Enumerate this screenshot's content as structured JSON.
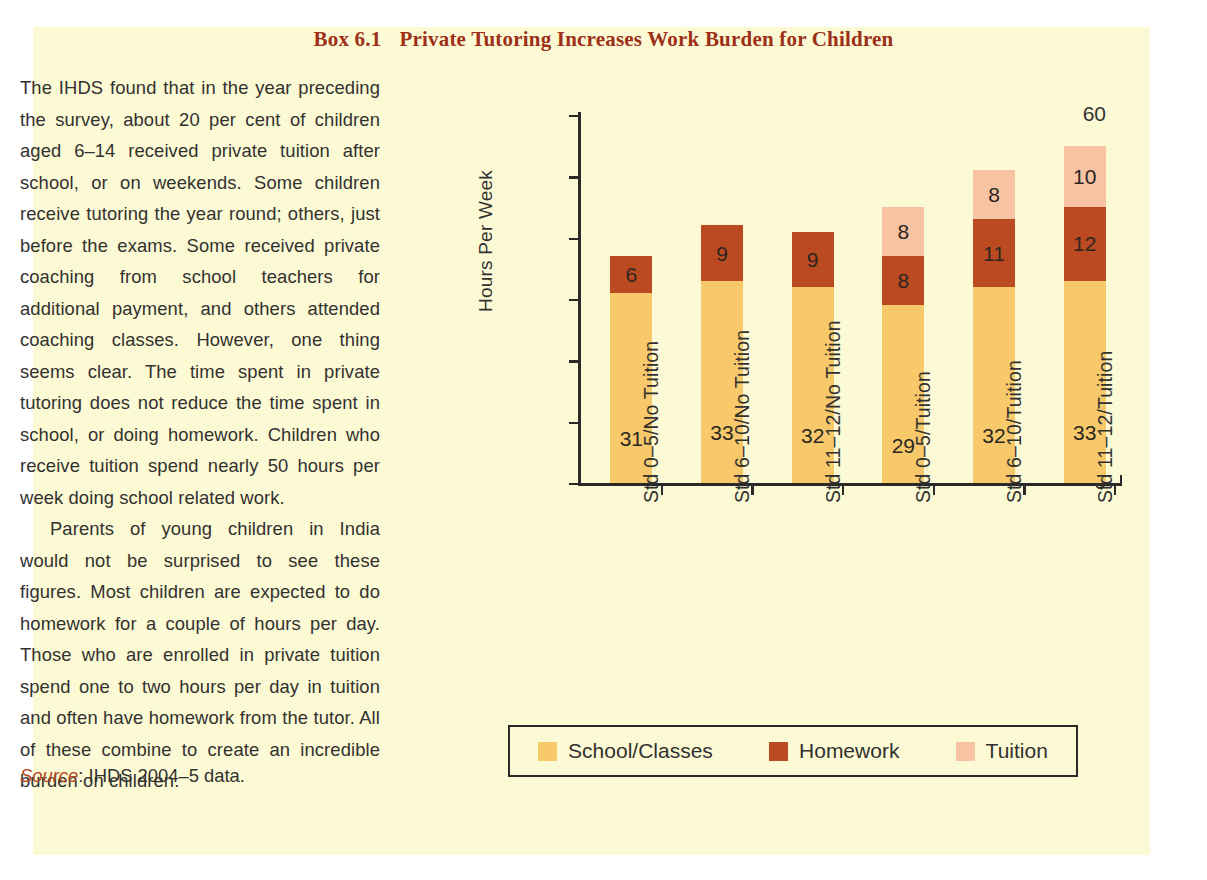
{
  "box": {
    "title_number": "Box 6.1",
    "title_text": "Private Tutoring Increases Work Burden for Children",
    "background_color": "#FCFAD4",
    "title_color": "#9E2F18"
  },
  "text_column": {
    "paragraphs": [
      "The IHDS found that in the year preceding the survey, about 20 per cent of children aged 6–14 received private tuition after school, or on weekends. Some children receive tutoring the year round; others, just before the exams. Some received private coaching from school teachers for additional payment, and others attended coaching classes. However, one thing seems clear. The time spent in private tutoring does not reduce the time spent in school, or doing homework. Children who receive tuition spend nearly 50 hours per week doing school related work.",
      "Parents of young children in India would not be surprised to see these figures. Most children are expected to do homework for a couple of hours per day. Those who are enrolled in private tuition spend one to two hours per day in tuition and often have homework from the tutor. All of these combine to create an incredible burden on children."
    ],
    "source_label": "Source",
    "source_separator": ": ",
    "source_value": "IHDS 2004–5 data."
  },
  "chart_data": {
    "type": "bar",
    "subtype": "stacked",
    "title": "Private Tutoring Increases Work Burden for Children",
    "xlabel": "",
    "ylabel": "Hours Per Week",
    "ylim": [
      0,
      60
    ],
    "yticks": [
      0,
      10,
      20,
      30,
      40,
      50,
      60
    ],
    "ytick_labels": [
      "0",
      "10",
      "20",
      "30",
      "40",
      "50",
      "60"
    ],
    "grid": false,
    "legend_position": "bottom",
    "categories": [
      "Std 0–5/No Tuition",
      "Std 6–10/No Tuition",
      "Std 11–12/No Tuition",
      "Std 0–5/Tuition",
      "Std 6–10/Tuition",
      "Std 11–12/Tuition"
    ],
    "series": [
      {
        "name": "School/Classes",
        "color": "#F7C96B",
        "values": [
          31,
          33,
          32,
          29,
          32,
          33
        ],
        "labels": [
          "31",
          "33",
          "32",
          "29",
          "32",
          "33"
        ]
      },
      {
        "name": "Homework",
        "color": "#BC4A20",
        "values": [
          6,
          9,
          9,
          8,
          11,
          12
        ],
        "labels": [
          "6",
          "9",
          "9",
          "8",
          "11",
          "12"
        ]
      },
      {
        "name": "Tuition",
        "color": "#F7C3A2",
        "values": [
          0,
          0,
          0,
          8,
          8,
          10
        ],
        "labels": [
          "",
          "",
          "",
          "8",
          "8",
          "10"
        ]
      }
    ],
    "totals": [
      37,
      42,
      41,
      45,
      51,
      55
    ]
  }
}
